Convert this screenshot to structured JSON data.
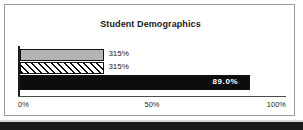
{
  "chart_data": {
    "type": "bar",
    "orientation": "horizontal",
    "title": "Student Demographics",
    "xlabel": "",
    "ylabel": "",
    "categories": [
      "series-1",
      "series-2",
      "series-3"
    ],
    "values": [
      31.5,
      31.5,
      89.0
    ],
    "data_labels": [
      "315%",
      "315%",
      "89.0%"
    ],
    "xlim": [
      0,
      100
    ],
    "ticks": [
      {
        "value": 0,
        "label": "0%",
        "align": "start"
      },
      {
        "value": 50,
        "label": "50%",
        "align": "center"
      },
      {
        "value": 100,
        "label": "100%",
        "align": "end"
      }
    ],
    "grid": false,
    "legend": "none",
    "series_styles": [
      "solid-gray",
      "diagonal-hatch",
      "solid-black"
    ],
    "colors": {
      "bar_gray": "#b4b4b4",
      "bar_hatch": "#111111",
      "bar_black": "#0d0d0d",
      "axis": "#1a1a1a",
      "text": "#1a1a1a",
      "inline_label": "#ffffff",
      "frame": "#9a9a9a"
    }
  }
}
